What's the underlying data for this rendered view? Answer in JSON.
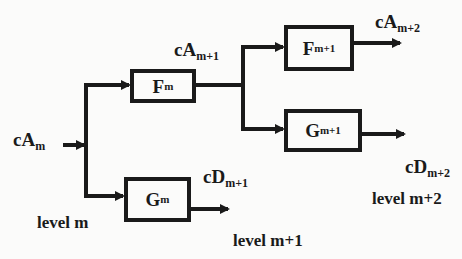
{
  "diagram": {
    "type": "wavelet-decomposition-tree",
    "input": {
      "base": "cA",
      "sub": "m"
    },
    "blocks": [
      {
        "id": "Fm",
        "base": "F",
        "sub": "m"
      },
      {
        "id": "Gm",
        "base": "G",
        "sub": "m"
      },
      {
        "id": "Fm1",
        "base": "F",
        "sub": "m+1"
      },
      {
        "id": "Gm1",
        "base": "G",
        "sub": "m+1"
      }
    ],
    "signals": [
      {
        "id": "cAm1",
        "base": "cA",
        "sub": "m+1"
      },
      {
        "id": "cDm1",
        "base": "cD",
        "sub": "m+1"
      },
      {
        "id": "cAm2",
        "base": "cA",
        "sub": "m+2"
      },
      {
        "id": "cDm2",
        "base": "cD",
        "sub": "m+2"
      }
    ],
    "levels": [
      "level m",
      "level m+1",
      "level m+2"
    ],
    "colors": {
      "stroke": "#1a1a1a",
      "background": "#fbfbfa"
    }
  }
}
